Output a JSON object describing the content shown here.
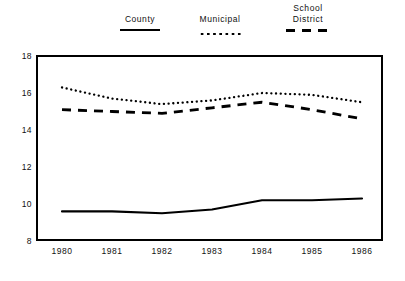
{
  "chart_data": {
    "type": "line",
    "title": "",
    "subtitle": "",
    "xlabel": "",
    "ylabel": "",
    "x": [
      1980,
      1981,
      1982,
      1983,
      1984,
      1985,
      1986
    ],
    "categories": [
      "1980",
      "1981",
      "1982",
      "1983",
      "1984",
      "1985",
      "1986"
    ],
    "xlim": [
      1980,
      1986
    ],
    "ylim": [
      8,
      18
    ],
    "yticks": [
      18,
      16,
      14,
      12,
      10,
      8
    ],
    "xticks": [
      "1980",
      "1981",
      "1982",
      "1983",
      "1984",
      "1985",
      "1986"
    ],
    "grid": false,
    "legend_position": "top",
    "series": [
      {
        "name": "County",
        "style": "solid",
        "color": "#000000",
        "values": [
          9.6,
          9.6,
          9.5,
          9.7,
          10.2,
          10.2,
          10.3
        ]
      },
      {
        "name": "Municipal",
        "style": "dotted",
        "color": "#000000",
        "values": [
          16.3,
          15.7,
          15.4,
          15.6,
          16.0,
          15.9,
          15.5
        ]
      },
      {
        "name": "School District",
        "style": "dashed",
        "color": "#000000",
        "values": [
          15.1,
          15.0,
          14.9,
          15.2,
          15.5,
          15.1,
          14.6
        ]
      }
    ]
  },
  "legend": {
    "items": [
      {
        "label": "County",
        "style": "solid"
      },
      {
        "label": "Municipal",
        "style": "dotted"
      },
      {
        "label": "School\nDistrict",
        "style": "dashed"
      }
    ]
  },
  "axes": {
    "y_labels": [
      "18",
      "16",
      "14",
      "12",
      "10",
      "8"
    ],
    "x_labels": [
      "1980",
      "1981",
      "1982",
      "1983",
      "1984",
      "1985",
      "1986"
    ]
  }
}
